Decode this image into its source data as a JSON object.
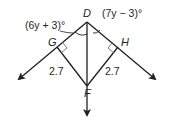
{
  "diagram": {
    "type": "geometry-figure",
    "points": {
      "D": {
        "label": "D"
      },
      "G": {
        "label": "G"
      },
      "H": {
        "label": "H"
      },
      "F": {
        "label": "F"
      }
    },
    "angles": {
      "left": "(6y + 3)°",
      "right": "(7y − 3)°"
    },
    "segments": {
      "GF": "2.7",
      "HF": "2.7"
    },
    "colors": {
      "stroke": "#231f20",
      "right_angle_mark": "#7a7a7a"
    }
  }
}
